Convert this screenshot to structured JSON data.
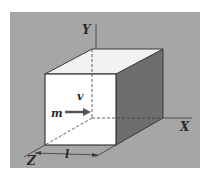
{
  "diagram": {
    "type": "3d-box-with-particle",
    "labels": {
      "y_axis": "Y",
      "x_axis": "X",
      "z_axis": "Z",
      "length": "l",
      "velocity": "v",
      "mass": "m"
    },
    "colors": {
      "background_panel": "#a6a6a6",
      "front_face": "#ffffff",
      "top_face": "#f2f2f2",
      "side_face": "#6e6e6e",
      "lines": "#3a3a3a",
      "arrow": "#555555"
    }
  }
}
